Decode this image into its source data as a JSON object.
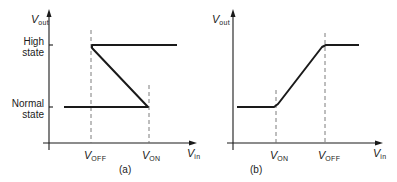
{
  "figure": {
    "panels": [
      {
        "id": "a",
        "caption": "(a)",
        "y_axis_label": {
          "main": "V",
          "sub": "out"
        },
        "x_axis_label": {
          "main": "V",
          "sub": "in"
        },
        "y_levels": [
          {
            "label_line1": "High",
            "label_line2": "state"
          },
          {
            "label_line1": "Normal",
            "label_line2": "state"
          }
        ],
        "x_markers": [
          {
            "main": "V",
            "sub": "OFF"
          },
          {
            "main": "V",
            "sub": "ON"
          }
        ]
      },
      {
        "id": "b",
        "caption": "(b)",
        "y_axis_label": {
          "main": "V",
          "sub": "out"
        },
        "x_axis_label": {
          "main": "V",
          "sub": "in"
        },
        "x_markers": [
          {
            "main": "V",
            "sub": "ON"
          },
          {
            "main": "V",
            "sub": "OFF"
          }
        ]
      }
    ],
    "colors": {
      "line": "#1a1a1a",
      "dash": "#6e6e6e",
      "background": "#ffffff"
    }
  }
}
